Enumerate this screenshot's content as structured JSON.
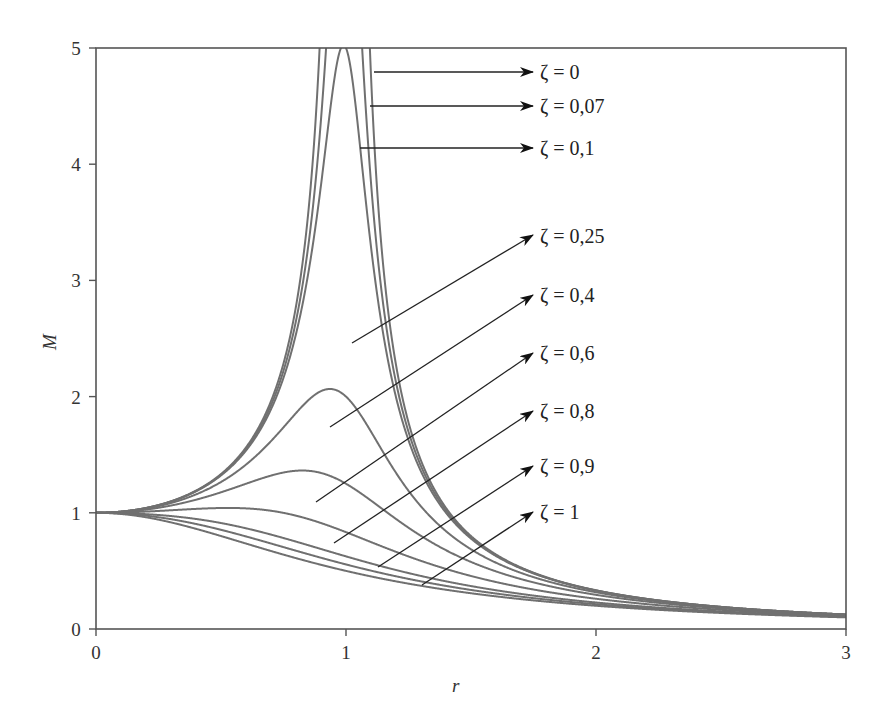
{
  "chart_data": {
    "type": "line",
    "title": "",
    "xlabel": "r",
    "ylabel": "M",
    "xlim": [
      0,
      3
    ],
    "ylim": [
      0,
      5
    ],
    "xticks": [
      "0",
      "1",
      "2",
      "3"
    ],
    "yticks": [
      "0",
      "1",
      "2",
      "3",
      "4",
      "5"
    ],
    "grid": false,
    "legend": "inline arrow annotations at right",
    "formula": "M = 1 / sqrt((1 - r^2)^2 + (2*zeta*r)^2)",
    "x": [
      0,
      0.25,
      0.5,
      0.75,
      0.9,
      1.0,
      1.1,
      1.25,
      1.5,
      2.0,
      2.5,
      3.0
    ],
    "series": [
      {
        "name": "ζ = 0",
        "zeta": 0,
        "values": [
          1.0,
          1.07,
          1.33,
          2.29,
          5.26,
          null,
          4.76,
          1.78,
          0.8,
          0.33,
          0.19,
          0.125
        ]
      },
      {
        "name": "ζ = 0,07",
        "zeta": 0.07,
        "values": [
          1.0,
          1.07,
          1.33,
          2.27,
          4.6,
          7.14,
          4.23,
          1.76,
          0.8,
          0.33,
          0.19,
          0.125
        ]
      },
      {
        "name": "ζ = 0,1",
        "zeta": 0.1,
        "values": [
          1.0,
          1.07,
          1.32,
          2.24,
          4.1,
          5.0,
          3.75,
          1.73,
          0.8,
          0.33,
          0.19,
          0.125
        ]
      },
      {
        "name": "ζ = 0,25",
        "zeta": 0.25,
        "values": [
          1.0,
          1.06,
          1.27,
          1.89,
          2.34,
          2.0,
          1.82,
          1.36,
          0.75,
          0.33,
          0.19,
          0.12
        ]
      },
      {
        "name": "ζ = 0,4",
        "zeta": 0.4,
        "values": [
          1.0,
          1.05,
          1.18,
          1.45,
          1.56,
          1.25,
          1.17,
          1.02,
          0.67,
          0.31,
          0.18,
          0.12
        ]
      },
      {
        "name": "ζ = 0,6",
        "zeta": 0.6,
        "values": [
          1.0,
          1.02,
          1.03,
          1.01,
          0.92,
          0.83,
          0.74,
          0.64,
          0.5,
          0.28,
          0.17,
          0.12
        ]
      },
      {
        "name": "ζ = 0,8",
        "zeta": 0.8,
        "values": [
          1.0,
          0.99,
          0.88,
          0.74,
          0.67,
          0.63,
          0.58,
          0.5,
          0.41,
          0.25,
          0.16,
          0.11
        ]
      },
      {
        "name": "ζ = 0,9",
        "zeta": 0.9,
        "values": [
          1.0,
          0.97,
          0.82,
          0.68,
          0.61,
          0.56,
          0.52,
          0.46,
          0.38,
          0.24,
          0.16,
          0.11
        ]
      },
      {
        "name": "ζ = 1",
        "zeta": 1,
        "values": [
          1.0,
          0.94,
          0.8,
          0.64,
          0.55,
          0.5,
          0.45,
          0.39,
          0.31,
          0.2,
          0.14,
          0.1
        ]
      }
    ],
    "annotations": [
      {
        "label": "ζ = 0",
        "from": [
          374,
          72
        ],
        "to": [
          533,
          72
        ],
        "text_pos": [
          540,
          79
        ]
      },
      {
        "label": "ζ = 0,07",
        "from": [
          370,
          106
        ],
        "to": [
          533,
          106
        ],
        "text_pos": [
          540,
          113
        ]
      },
      {
        "label": "ζ = 0,1",
        "from": [
          360,
          148
        ],
        "to": [
          533,
          148
        ],
        "text_pos": [
          540,
          155
        ]
      },
      {
        "label": "ζ = 0,25",
        "from": [
          352,
          343
        ],
        "to": [
          533,
          235
        ],
        "text_pos": [
          540,
          243
        ]
      },
      {
        "label": "ζ = 0,4",
        "from": [
          330,
          427
        ],
        "to": [
          533,
          295
        ],
        "text_pos": [
          540,
          302
        ]
      },
      {
        "label": "ζ = 0,6",
        "from": [
          316,
          502
        ],
        "to": [
          533,
          353
        ],
        "text_pos": [
          540,
          360
        ]
      },
      {
        "label": "ζ = 0,8",
        "from": [
          334,
          543
        ],
        "to": [
          533,
          411
        ],
        "text_pos": [
          540,
          418
        ]
      },
      {
        "label": "ζ = 0,9",
        "from": [
          378,
          567
        ],
        "to": [
          533,
          466
        ],
        "text_pos": [
          540,
          473
        ]
      },
      {
        "label": "ζ = 1",
        "from": [
          422,
          585
        ],
        "to": [
          533,
          512
        ],
        "text_pos": [
          540,
          519
        ]
      }
    ],
    "colors": {
      "curve": "#707070",
      "frame": "#555555",
      "arrow": "#222222",
      "text": "#333333"
    }
  },
  "plot": {
    "left": 96,
    "right": 846,
    "top": 48,
    "bottom": 629
  }
}
